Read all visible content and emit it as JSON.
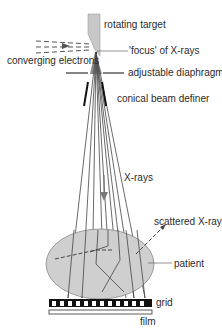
{
  "diagram": {
    "labels": {
      "rotating_target": "rotating target",
      "focus": "'focus' of X-rays",
      "converging_electrons": "converging electrons",
      "adjustable_diaphragm": "adjustable diaphragm",
      "conical_beam_definer": "conical beam definer",
      "xrays": "X-rays",
      "scattered_xray": "scattered X-ray",
      "patient": "patient",
      "grid": "grid",
      "film": "film"
    },
    "colors": {
      "target_fill": "#c8c8c8",
      "patient_fill": "#cfcfcf",
      "line": "#3a3a3a",
      "grid_black": "#111111",
      "background": "#ffffff"
    }
  }
}
